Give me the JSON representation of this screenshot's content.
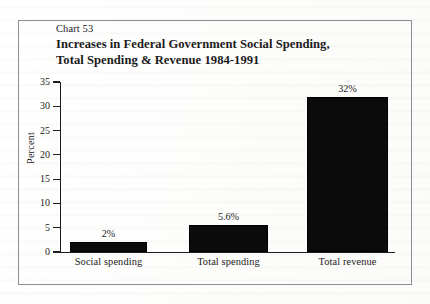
{
  "figure": {
    "chart_number": "Chart 53",
    "title_line_1": "Increases in Federal Government Social Spending,",
    "title_line_2": "Total Spending & Revenue 1984-1991"
  },
  "chart_data": {
    "type": "bar",
    "title": "Increases in Federal Government Social Spending, Total Spending & Revenue 1984-1991",
    "subtitle": "Chart 53",
    "xlabel": "",
    "ylabel": "Percent",
    "ylim": [
      0,
      35
    ],
    "ytick_labels": [
      "0",
      "5",
      "10",
      "15",
      "20",
      "25",
      "30",
      "35"
    ],
    "ytick_values": [
      0,
      5,
      10,
      15,
      20,
      25,
      30,
      35
    ],
    "grid": false,
    "legend": false,
    "bar_color": "#0b0b0b",
    "categories": [
      "Social spending",
      "Total spending",
      "Total revenue"
    ],
    "values": [
      2,
      5.6,
      32
    ],
    "data_labels": [
      "2%",
      "5.6%",
      "32%"
    ]
  }
}
